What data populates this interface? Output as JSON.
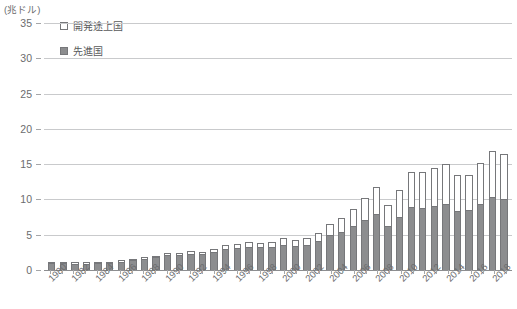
{
  "unit_label": "(兆ドル)",
  "legend": {
    "items": [
      {
        "label": "開発途上国",
        "swatch": "open-square-icon",
        "color": "#ffffff"
      },
      {
        "label": "先進国",
        "swatch": "filled-square-icon",
        "color": "#8c8d8f"
      }
    ]
  },
  "colors": {
    "developed": "#8c8d8f",
    "developing": "#ffffff",
    "bar_outline": "#76777a",
    "grid": "#c9cacc",
    "axis": "#8d8e90",
    "text": "#58595b"
  },
  "chart_data": {
    "type": "bar",
    "title": "",
    "subtitle": "",
    "xlabel": "",
    "ylabel": "(兆ドル)",
    "ylim": [
      0,
      35
    ],
    "yticks": [
      0,
      5,
      10,
      15,
      20,
      25,
      30,
      35
    ],
    "ytick_labels": [
      "0",
      "5",
      "10",
      "15",
      "20",
      "25",
      "30",
      "35"
    ],
    "grid": true,
    "stacked": true,
    "legend_position": "top-left",
    "categories": [
      "1980",
      "1981",
      "1982",
      "1983",
      "1984",
      "1985",
      "1986",
      "1987",
      "1988",
      "1989",
      "1990",
      "1991",
      "1992",
      "1993",
      "1994",
      "1995",
      "1996",
      "1997",
      "1998",
      "1999",
      "2000",
      "2001",
      "2002",
      "2003",
      "2004",
      "2005",
      "2006",
      "2007",
      "2008",
      "2009",
      "2010",
      "2011",
      "2012",
      "2013",
      "2014",
      "2015",
      "2016",
      "2017",
      "2018",
      "2019"
    ],
    "xtick_labels": [
      "1980",
      "1982",
      "1984",
      "1986",
      "1988",
      "1990",
      "1992",
      "1994",
      "1996",
      "1998",
      "2000",
      "2002",
      "2004",
      "2006",
      "2008",
      "2010",
      "2012",
      "2014",
      "2016",
      "2018"
    ],
    "series": [
      {
        "name": "先進国",
        "color": "#8c8d8f",
        "values": [
          1.0,
          1.0,
          0.9,
          0.9,
          1.0,
          1.0,
          1.2,
          1.4,
          1.6,
          1.8,
          2.1,
          2.1,
          2.3,
          2.2,
          2.5,
          3.0,
          3.1,
          3.2,
          3.2,
          3.3,
          3.6,
          3.4,
          3.5,
          4.1,
          4.9,
          5.4,
          6.2,
          7.1,
          7.9,
          6.2,
          7.5,
          9.0,
          8.8,
          9.1,
          9.4,
          8.4,
          8.5,
          9.4,
          10.3,
          10.0
        ]
      },
      {
        "name": "開発途上国",
        "color": "#ffffff",
        "values": [
          0.1,
          0.1,
          0.1,
          0.1,
          0.1,
          0.1,
          0.1,
          0.2,
          0.2,
          0.2,
          0.3,
          0.3,
          0.4,
          0.4,
          0.5,
          0.6,
          0.6,
          0.7,
          0.6,
          0.7,
          0.9,
          0.9,
          1.0,
          1.2,
          1.6,
          2.0,
          2.5,
          3.1,
          3.8,
          3.0,
          3.9,
          4.9,
          5.1,
          5.4,
          5.6,
          5.1,
          5.0,
          5.7,
          6.5,
          6.4
        ]
      }
    ],
    "totals": [
      1.1,
      1.1,
      1.0,
      1.0,
      1.1,
      1.1,
      1.3,
      1.6,
      1.8,
      2.0,
      2.4,
      2.4,
      2.7,
      2.6,
      3.0,
      3.6,
      3.7,
      3.9,
      3.8,
      4.0,
      4.5,
      4.3,
      4.5,
      5.3,
      6.5,
      7.4,
      8.7,
      10.2,
      11.7,
      9.2,
      11.4,
      13.9,
      13.9,
      14.5,
      15.0,
      13.5,
      13.5,
      15.1,
      16.8,
      16.4
    ]
  }
}
